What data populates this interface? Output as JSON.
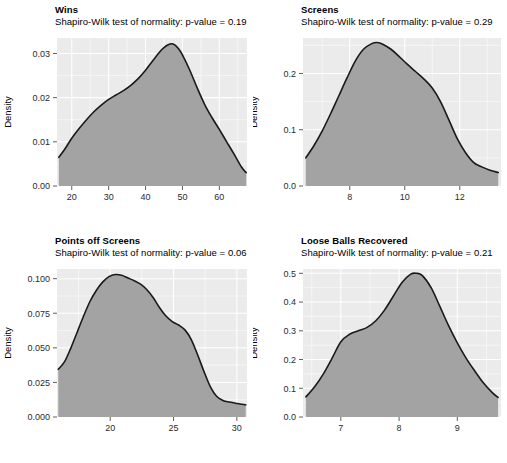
{
  "figure": {
    "type": "density-facet-grid",
    "rows": 2,
    "columns": 2,
    "y_axis_label": "Density",
    "subtitle_prefix": "Shapiro-Wilk test of normality: p-value =",
    "panel_background_color": "#ebebeb",
    "gridline_color": "#ffffff",
    "density_fill_color": "#a3a3a3",
    "density_line_color": "#1a1a1a"
  },
  "panels": [
    {
      "id": "wins",
      "title": "Wins",
      "subtitle": "Shapiro-Wilk test of normality: p-value = 0.19",
      "p_value": "0.19",
      "ylabel": "Density",
      "x_ticks": [
        "20",
        "30",
        "40",
        "50",
        "60"
      ],
      "x_tick_values": [
        20,
        30,
        40,
        50,
        60
      ],
      "y_ticks": [
        "0.00",
        "0.01",
        "0.02",
        "0.03"
      ],
      "y_tick_values": [
        0.0,
        0.01,
        0.02,
        0.03
      ],
      "xlim": [
        16.0,
        67.5
      ],
      "ylim": [
        0.0,
        0.0335
      ]
    },
    {
      "id": "screens",
      "title": "Screens",
      "subtitle": "Shapiro-Wilk test of normality: p-value = 0.29",
      "p_value": "0.29",
      "ylabel": "Density",
      "x_ticks": [
        "8",
        "10",
        "12"
      ],
      "x_tick_values": [
        8,
        10,
        12
      ],
      "y_ticks": [
        "0.0",
        "0.1",
        "0.2"
      ],
      "y_tick_values": [
        0.0,
        0.1,
        0.2
      ],
      "xlim": [
        6.3,
        13.5
      ],
      "ylim": [
        0.0,
        0.263
      ]
    },
    {
      "id": "points-off-screens",
      "title": "Points off Screens",
      "subtitle": "Shapiro-Wilk test of normality: p-value = 0.06",
      "p_value": "0.06",
      "ylabel": "Density",
      "x_ticks": [
        "20",
        "25",
        "30"
      ],
      "x_tick_values": [
        20,
        25,
        30
      ],
      "y_ticks": [
        "0.000",
        "0.025",
        "0.050",
        "0.075",
        "0.100"
      ],
      "y_tick_values": [
        0.0,
        0.025,
        0.05,
        0.075,
        0.1
      ],
      "xlim": [
        15.8,
        30.8
      ],
      "ylim": [
        0.0,
        0.107
      ]
    },
    {
      "id": "loose-balls-recovered",
      "title": "Loose Balls Recovered",
      "subtitle": "Shapiro-Wilk test of normality: p-value = 0.21",
      "p_value": "0.21",
      "ylabel": "Density",
      "x_ticks": [
        "7",
        "8",
        "9"
      ],
      "x_tick_values": [
        7,
        8,
        9
      ],
      "y_ticks": [
        "0.0",
        "0.1",
        "0.2",
        "0.3",
        "0.4",
        "0.5"
      ],
      "y_tick_values": [
        0.0,
        0.1,
        0.2,
        0.3,
        0.4,
        0.5
      ],
      "xlim": [
        6.35,
        9.75
      ],
      "ylim": [
        0.0,
        0.515
      ]
    }
  ],
  "chart_data": [
    {
      "type": "area",
      "title": "Wins",
      "subtitle": "Shapiro-Wilk test of normality: p-value = 0.19",
      "xlabel": "",
      "ylabel": "Density",
      "xlim": [
        16.0,
        67.5
      ],
      "ylim": [
        0.0,
        0.0335
      ],
      "grid": true,
      "legend": "none",
      "x": [
        16.5,
        18,
        20,
        22,
        24,
        26,
        28,
        30,
        32,
        34,
        36,
        38,
        40,
        42,
        44,
        45,
        46,
        47,
        48,
        49,
        50,
        52,
        54,
        56,
        58,
        60,
        62,
        64,
        66,
        67.3
      ],
      "y": [
        0.0065,
        0.0082,
        0.0108,
        0.013,
        0.015,
        0.0168,
        0.0183,
        0.0196,
        0.0206,
        0.0216,
        0.0228,
        0.0243,
        0.0262,
        0.0284,
        0.0305,
        0.0313,
        0.0319,
        0.0322,
        0.0319,
        0.031,
        0.0297,
        0.0262,
        0.0222,
        0.0185,
        0.0155,
        0.0128,
        0.01,
        0.0072,
        0.0043,
        0.003
      ]
    },
    {
      "type": "area",
      "title": "Screens",
      "subtitle": "Shapiro-Wilk test of normality: p-value = 0.29",
      "xlabel": "",
      "ylabel": "Density",
      "xlim": [
        6.3,
        13.5
      ],
      "ylim": [
        0.0,
        0.263
      ],
      "grid": true,
      "legend": "none",
      "x": [
        6.4,
        6.7,
        7.0,
        7.3,
        7.6,
        7.9,
        8.2,
        8.5,
        8.8,
        9.0,
        9.2,
        9.5,
        9.8,
        10.1,
        10.4,
        10.7,
        11.0,
        11.3,
        11.6,
        11.9,
        12.2,
        12.5,
        12.8,
        13.1,
        13.4
      ],
      "y": [
        0.05,
        0.072,
        0.098,
        0.128,
        0.16,
        0.192,
        0.222,
        0.243,
        0.253,
        0.255,
        0.252,
        0.243,
        0.23,
        0.216,
        0.203,
        0.19,
        0.174,
        0.15,
        0.118,
        0.085,
        0.06,
        0.042,
        0.034,
        0.028,
        0.024
      ]
    },
    {
      "type": "area",
      "title": "Points off Screens",
      "subtitle": "Shapiro-Wilk test of normality: p-value = 0.06",
      "xlabel": "",
      "ylabel": "Density",
      "xlim": [
        15.8,
        30.8
      ],
      "ylim": [
        0.0,
        0.107
      ],
      "grid": true,
      "legend": "none",
      "x": [
        15.9,
        16.4,
        16.9,
        17.4,
        17.9,
        18.4,
        18.9,
        19.4,
        19.9,
        20.4,
        20.9,
        21.4,
        21.9,
        22.4,
        22.9,
        23.4,
        23.9,
        24.4,
        24.9,
        25.4,
        25.9,
        26.4,
        26.9,
        27.4,
        27.9,
        28.4,
        28.9,
        29.4,
        29.9,
        30.4,
        30.7
      ],
      "y": [
        0.0345,
        0.04,
        0.05,
        0.0615,
        0.073,
        0.0835,
        0.0915,
        0.0975,
        0.1015,
        0.103,
        0.1025,
        0.1005,
        0.0985,
        0.096,
        0.092,
        0.0862,
        0.079,
        0.073,
        0.069,
        0.0665,
        0.063,
        0.056,
        0.045,
        0.033,
        0.022,
        0.015,
        0.012,
        0.0108,
        0.01,
        0.0092,
        0.0088
      ]
    },
    {
      "type": "area",
      "title": "Loose Balls Recovered",
      "subtitle": "Shapiro-Wilk test of normality: p-value = 0.21",
      "xlabel": "",
      "ylabel": "Density",
      "xlim": [
        6.35,
        9.75
      ],
      "ylim": [
        0.0,
        0.515
      ],
      "grid": true,
      "legend": "none",
      "x": [
        6.4,
        6.55,
        6.7,
        6.85,
        7.0,
        7.15,
        7.3,
        7.45,
        7.6,
        7.75,
        7.9,
        8.05,
        8.2,
        8.3,
        8.4,
        8.55,
        8.7,
        8.85,
        9.0,
        9.15,
        9.3,
        9.45,
        9.6,
        9.7
      ],
      "y": [
        0.07,
        0.105,
        0.15,
        0.205,
        0.262,
        0.288,
        0.3,
        0.312,
        0.335,
        0.372,
        0.42,
        0.468,
        0.497,
        0.5,
        0.492,
        0.45,
        0.385,
        0.318,
        0.258,
        0.205,
        0.16,
        0.118,
        0.085,
        0.068
      ]
    }
  ]
}
